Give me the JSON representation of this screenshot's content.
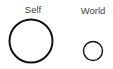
{
  "diagram": {
    "nodes": [
      {
        "id": "self",
        "label": "Self",
        "cx": 31,
        "cy": 41,
        "r": 21.5,
        "stroke_width": 2,
        "label_x": 33,
        "label_y": 5
      },
      {
        "id": "world",
        "label": "World",
        "cx": 93,
        "cy": 51,
        "r": 9.5,
        "stroke_width": 1.4,
        "label_x": 93,
        "label_y": 6
      }
    ],
    "colors": {
      "stroke": "#111111",
      "label": "#444444",
      "background": "#ffffff"
    }
  }
}
